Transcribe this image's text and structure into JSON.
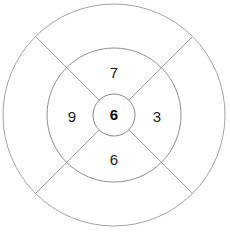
{
  "diagram": {
    "type": "concentric-circle-sector-puzzle",
    "geometry": {
      "center_x": 114,
      "center_y": 115,
      "outer_radius": 111,
      "middle_radius": 67,
      "inner_radius": 21,
      "divider_angles_deg": [
        45,
        135,
        225,
        315
      ]
    },
    "colors": {
      "stroke": "#9a9a9a",
      "inner_stroke": "#8a8a8a",
      "background": "#ffffff",
      "text": "#1a1a1a",
      "center_text": "#000000"
    },
    "circles": [
      {
        "name": "outer-circle",
        "radius": 111
      },
      {
        "name": "middle-circle",
        "radius": 67
      },
      {
        "name": "inner-circle",
        "radius": 21
      }
    ],
    "dividers": [
      {
        "name": "divider-line-nw-se",
        "angle_deg": 135
      },
      {
        "name": "divider-line-ne-sw",
        "angle_deg": 45
      }
    ],
    "sectors": [
      {
        "position": "top",
        "value": "7",
        "x": 114,
        "y": 74,
        "bold": false
      },
      {
        "position": "left",
        "value": "9",
        "x": 72,
        "y": 118,
        "bold": false
      },
      {
        "position": "right",
        "value": "3",
        "x": 157,
        "y": 118,
        "bold": false
      },
      {
        "position": "bottom",
        "value": "6",
        "x": 114,
        "y": 161,
        "bold": false
      }
    ],
    "center": {
      "position": "center",
      "value": "6",
      "x": 114,
      "y": 116,
      "bold": true
    }
  }
}
